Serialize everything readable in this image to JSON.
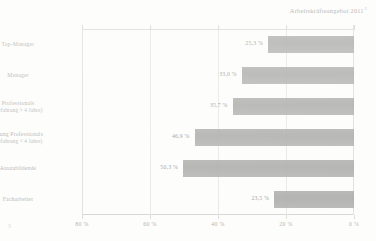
{
  "chart_data": {
    "type": "bar",
    "orientation": "horizontal",
    "title": "Arbeitskräfteangebot 2011",
    "title_footnote_marker": "2",
    "xlabel": "",
    "ylabel": "",
    "xlim": [
      0,
      80
    ],
    "x_axis_reversed": true,
    "grid": true,
    "legend": "none",
    "xticks": [
      "80 %",
      "60 %",
      "40 %",
      "20 %",
      "0 %"
    ],
    "xtick_values": [
      80,
      60,
      40,
      20,
      0
    ],
    "value_suffix": "%",
    "decimal_separator": ",",
    "categories": [
      "Top-Manager",
      "Manager",
      "Professionals",
      "Young Professionals",
      "Auszubildende",
      "Facharbeiter"
    ],
    "category_sublabels": [
      "",
      "",
      "(Erfahrung > 4 Jahre)",
      "(Erfahrung < 4 Jahre)",
      "",
      ""
    ],
    "values": [
      25.3,
      33.0,
      35.7,
      46.9,
      50.3,
      23.5
    ],
    "value_labels": [
      "25,3 %",
      "33,0 %",
      "35,7 %",
      "46,9 %",
      "50,3 %",
      "23,5 %"
    ],
    "bar_color": "#9c9c99",
    "grid_color": "#e6e5e1",
    "axis_color": "#d9d8d4",
    "text_color": "#a6a6a2"
  },
  "corner": {
    "mark": "3"
  }
}
